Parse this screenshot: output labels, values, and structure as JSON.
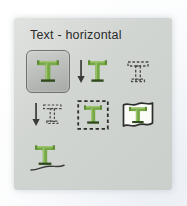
{
  "panel": {
    "title": "Text - horizontal",
    "colors": {
      "panel_background": "#cfd3cf",
      "page_background": "#f6f8fa",
      "title_text": "#2b2b2b",
      "glyph_green": "#76a845",
      "glyph_green_dark": "#4f7a2e",
      "outline_dark": "#3a3a3a",
      "selected_button_background": "#b9bdb9",
      "selected_button_border": "#6f7470"
    }
  },
  "tools": [
    {
      "id": "text-horizontal",
      "icon": "text-horizontal-icon",
      "label": "Text - horizontal",
      "selected": true
    },
    {
      "id": "text-vertical",
      "icon": "text-vertical-arrow-icon",
      "label": "Text - vertical",
      "selected": false
    },
    {
      "id": "text-mask-horizontal",
      "icon": "text-mask-horizontal-icon",
      "label": "Horizontal type mask",
      "selected": false
    },
    {
      "id": "text-mask-vertical",
      "icon": "text-mask-vertical-arrow-icon",
      "label": "Vertical type mask",
      "selected": false
    },
    {
      "id": "text-in-box",
      "icon": "text-in-bounding-box-icon",
      "label": "Text in box",
      "selected": false
    },
    {
      "id": "text-warp",
      "icon": "text-warp-icon",
      "label": "Warped text",
      "selected": false
    },
    {
      "id": "text-on-path",
      "icon": "text-on-path-icon",
      "label": "Text on path",
      "selected": false
    }
  ]
}
